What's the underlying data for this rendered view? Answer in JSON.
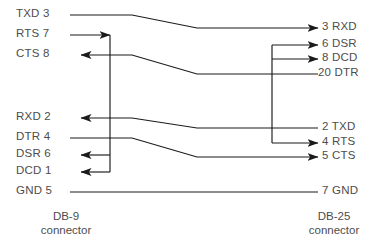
{
  "diagram": {
    "type": "wiring-schematic",
    "colors": {
      "wire": "#1a1a1a",
      "text": "#4d4d4d",
      "background": "#ffffff"
    },
    "left_connector": {
      "caption_line1": "DB-9",
      "caption_line2": "connector",
      "pins": [
        {
          "label": "TXD 3",
          "signal": "TXD",
          "pin": "3",
          "y": 15
        },
        {
          "label": "RTS 7",
          "signal": "RTS",
          "pin": "7",
          "y": 35
        },
        {
          "label": "CTS 8",
          "signal": "CTS",
          "pin": "8",
          "y": 55
        },
        {
          "label": "RXD 2",
          "signal": "RXD",
          "pin": "2",
          "y": 118
        },
        {
          "label": "DTR 4",
          "signal": "DTR",
          "pin": "4",
          "y": 138
        },
        {
          "label": "DSR 6",
          "signal": "DSR",
          "pin": "6",
          "y": 155
        },
        {
          "label": "DCD 1",
          "signal": "DCD",
          "pin": "1",
          "y": 172
        },
        {
          "label": "GND 5",
          "signal": "GND",
          "pin": "5",
          "y": 192
        }
      ]
    },
    "right_connector": {
      "caption_line1": "DB-25",
      "caption_line2": "connector",
      "pins": [
        {
          "label": "3 RXD",
          "signal": "RXD",
          "pin": "3",
          "y": 28
        },
        {
          "label": "6 DSR",
          "signal": "DSR",
          "pin": "6",
          "y": 45
        },
        {
          "label": "8 DCD",
          "signal": "DCD",
          "pin": "8",
          "y": 59
        },
        {
          "label": "20 DTR",
          "signal": "DTR",
          "pin": "20",
          "y": 74
        },
        {
          "label": "2 TXD",
          "signal": "TXD",
          "pin": "2",
          "y": 128
        },
        {
          "label": "4 RTS",
          "signal": "RTS",
          "pin": "4",
          "y": 143
        },
        {
          "label": "5 CTS",
          "signal": "CTS",
          "pin": "5",
          "y": 157
        },
        {
          "label": "7 GND",
          "signal": "GND",
          "pin": "7",
          "y": 192
        }
      ]
    },
    "connections": [
      {
        "from": "TXD 3",
        "to": "3 RXD",
        "direction": "left-to-right"
      },
      {
        "from": "CTS 8",
        "to": "20 DTR",
        "direction": "right-to-left"
      },
      {
        "from": "RXD 2",
        "to": "2 TXD",
        "direction": "right-to-left"
      },
      {
        "from": "DTR 4",
        "to": "5 CTS",
        "direction": "left-to-right"
      },
      {
        "from": "GND 5",
        "to": "7 GND",
        "direction": "none"
      },
      {
        "from": "RTS 7",
        "to": "DSR 6 + DCD 1",
        "direction": "local-jumper-left"
      },
      {
        "from": "4 RTS",
        "to": "6 DSR + 8 DCD",
        "direction": "local-jumper-right"
      }
    ]
  }
}
